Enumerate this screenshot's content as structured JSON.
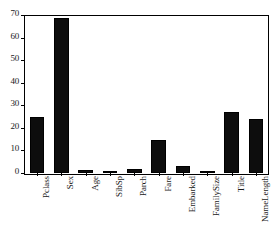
{
  "chart_data": {
    "type": "bar",
    "title": "",
    "subtitle": "",
    "xlabel": "",
    "ylabel": "",
    "categories": [
      "Pclass",
      "Sex",
      "Age",
      "SibSp",
      "Parch",
      "Fare",
      "Embarked",
      "FamilySize",
      "Title",
      "NameLength"
    ],
    "values": [
      24.8,
      68.8,
      1.3,
      0.7,
      1.8,
      14.5,
      2.9,
      0.2,
      27.1,
      23.8
    ],
    "ylim": [
      0,
      70
    ],
    "yticks": [
      0,
      10,
      20,
      30,
      40,
      50,
      60,
      70
    ],
    "ytick_labels": [
      "0",
      "10",
      "20",
      "30",
      "40",
      "50",
      "60",
      "70"
    ],
    "grid": false,
    "legend": null,
    "bar_color": "#0d0d0d",
    "axis_color": "#000000",
    "background_color": "#ffffff"
  }
}
